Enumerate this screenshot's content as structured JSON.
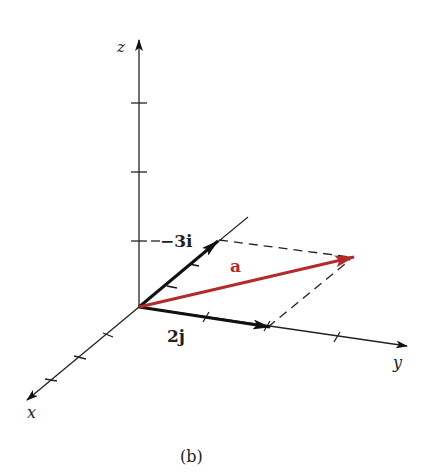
{
  "diagram": {
    "axes": {
      "x_label": "x",
      "y_label": "y",
      "z_label": "z"
    },
    "vectors": {
      "neg3i_label": "−3i",
      "twoj_label": "2j",
      "a_label": "a"
    },
    "caption": "(b)",
    "colors": {
      "axis": "#222222",
      "vector_a": "#b22a2a",
      "component": "#111111"
    }
  }
}
